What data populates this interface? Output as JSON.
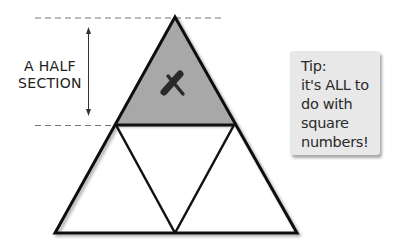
{
  "diagram": {
    "label": {
      "line1": "A HALF",
      "line2": "SECTION"
    },
    "mark": "X",
    "colors": {
      "shaded": "#a8a8a8",
      "stroke": "#111111",
      "dash": "#777777",
      "note_bg": "#e8e8e8"
    },
    "shapes": {
      "outer_triangle": {
        "apex": [
          175,
          17
        ],
        "base_left": [
          55,
          233
        ],
        "base_right": [
          297,
          233
        ]
      },
      "shaded_top_triangle": {
        "apex": [
          175,
          17
        ],
        "left": [
          116,
          125
        ],
        "right": [
          234,
          125
        ]
      },
      "lower_triangles": 3
    }
  },
  "tip": {
    "text": "Tip:\nit's ALL to\ndo with\nsquare\nnumbers!"
  }
}
